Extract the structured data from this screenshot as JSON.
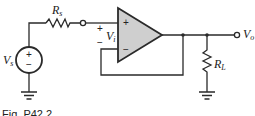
{
  "figure": {
    "caption": "Fig. P42.2",
    "labels": {
      "source_resistor": "R",
      "source_resistor_sub": "s",
      "source_voltage": "V",
      "source_voltage_sub": "s",
      "input_voltage": "V",
      "input_voltage_sub": "i",
      "load_resistor": "R",
      "load_resistor_sub": "L",
      "output_voltage": "V",
      "output_voltage_sub": "o",
      "plus": "+",
      "minus": "−"
    },
    "colors": {
      "line": "#2a2a2a",
      "opamp_fill": "#cfcfcf"
    }
  }
}
